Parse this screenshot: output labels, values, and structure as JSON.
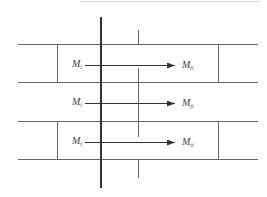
{
  "diagram": {
    "type": "force-flow-schematic",
    "rows": [
      {
        "from_label": "M",
        "from_sub": "i",
        "to_label": "M",
        "to_sub": "ti",
        "boxed": true
      },
      {
        "from_label": "M",
        "from_sub": "i",
        "to_label": "M",
        "to_sub": "ji",
        "boxed": false
      },
      {
        "from_label": "M",
        "from_sub": "i",
        "to_label": "M",
        "to_sub": "ti",
        "boxed": true
      }
    ],
    "colors": {
      "line": "#555555",
      "thick_line": "#333333",
      "text": "#444444"
    }
  }
}
